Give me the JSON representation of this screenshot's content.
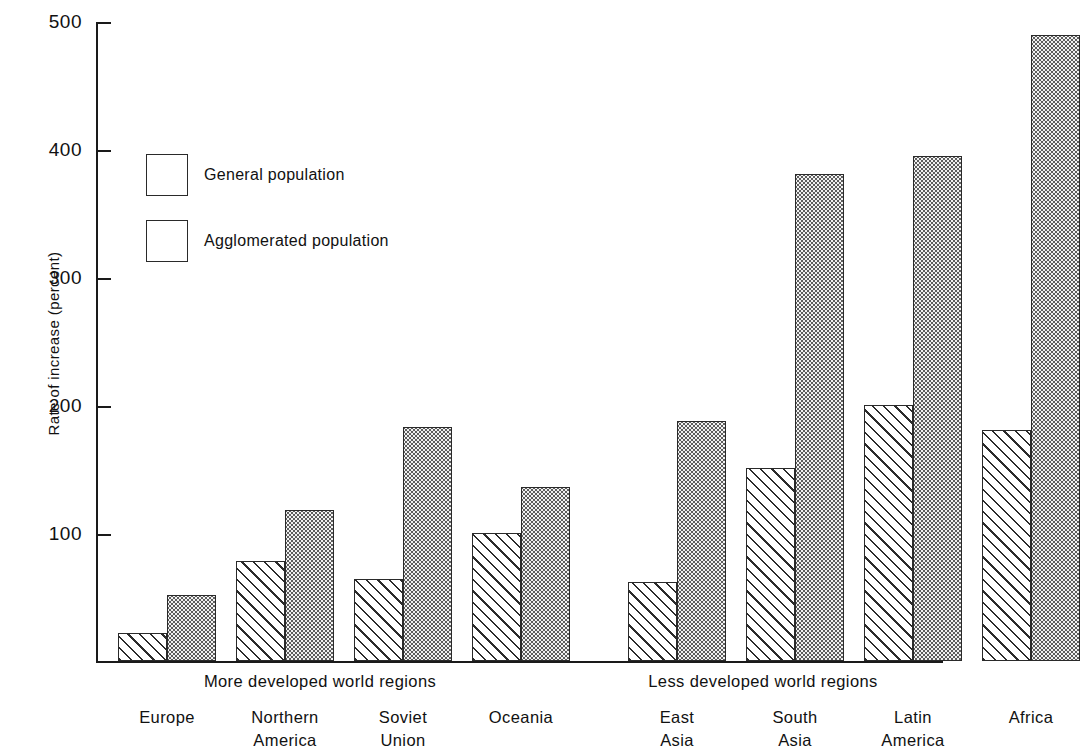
{
  "chart_data": {
    "type": "bar",
    "title": "",
    "xlabel": "",
    "ylabel": "Rate of increase  (percent)",
    "ylim": [
      0,
      500
    ],
    "yticks": [
      100,
      200,
      300,
      400,
      500
    ],
    "ytick_labels": [
      "100",
      "200",
      "300",
      "400",
      "500"
    ],
    "grid": false,
    "legend_position": "upper-left-inside",
    "categories": [
      "Europe",
      "Northern America",
      "Soviet Union",
      "Oceania",
      "East Asia",
      "South Asia",
      "Latin America",
      "Africa"
    ],
    "series": [
      {
        "name": "General population",
        "pattern": "diagonal-hatch",
        "values": [
          22,
          78,
          64,
          100,
          62,
          151,
          200,
          181
        ]
      },
      {
        "name": "Agglomerated population",
        "pattern": "stipple-dots",
        "values": [
          52,
          118,
          183,
          136,
          188,
          381,
          395,
          490
        ]
      }
    ],
    "groups": [
      {
        "label": "More developed world regions",
        "categories": [
          "Europe",
          "Northern America",
          "Soviet Union",
          "Oceania"
        ]
      },
      {
        "label": "Less developed world regions",
        "categories": [
          "East Asia",
          "South Asia",
          "Latin America",
          "Africa"
        ]
      }
    ]
  },
  "axis": {
    "y_title": "Rate of  increase  (percent)",
    "ticks": [
      {
        "value": "500"
      },
      {
        "value": "400"
      },
      {
        "value": "300"
      },
      {
        "value": "200"
      },
      {
        "value": "100"
      }
    ]
  },
  "legend": {
    "items": [
      {
        "label": "General population",
        "pattern": "diagonal-hatch"
      },
      {
        "label": "Agglomerated population",
        "pattern": "stipple-dots"
      }
    ]
  },
  "groups": [
    {
      "label": "More developed world regions"
    },
    {
      "label": "Less developed world regions"
    }
  ],
  "categories": [
    {
      "line1": "Europe",
      "line2": ""
    },
    {
      "line1": "Northern",
      "line2": "America"
    },
    {
      "line1": "Soviet",
      "line2": "Union"
    },
    {
      "line1": "Oceania",
      "line2": ""
    },
    {
      "line1": "East",
      "line2": "Asia"
    },
    {
      "line1": "South",
      "line2": "Asia"
    },
    {
      "line1": "Latin",
      "line2": "America"
    },
    {
      "line1": "Africa",
      "line2": ""
    }
  ],
  "colors": {
    "ink": "#1a1a1a",
    "background": "#ffffff",
    "hatch": "#2b2b2b",
    "stipple": "#5e5e5e"
  }
}
